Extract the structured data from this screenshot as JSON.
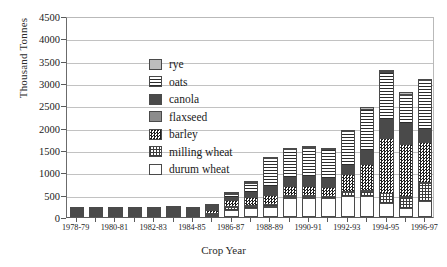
{
  "chart_data": {
    "type": "bar",
    "stacked": true,
    "title": "",
    "xlabel": "Crop Year",
    "ylabel": "Thousand Tonnes",
    "ylim": [
      0,
      4500
    ],
    "ytick_step": 500,
    "grid": true,
    "legend_position": "inside-upper-left",
    "yticks": [
      "0",
      "500",
      "1000",
      "1500",
      "2000",
      "2500",
      "3000",
      "3500",
      "4000",
      "4500"
    ],
    "categories": [
      "1978-79",
      "1979-80",
      "1980-81",
      "1981-82",
      "1982-83",
      "1983-84",
      "1984-85",
      "1985-86",
      "1986-87",
      "1987-88",
      "1988-89",
      "1989-90",
      "1990-91",
      "1991-92",
      "1992-93",
      "1993-94",
      "1994-95",
      "1995-96",
      "1996-97"
    ],
    "xtick_labels": [
      "1978-79",
      "1980-81",
      "1982-83",
      "1984-85",
      "1986-87",
      "1988-89",
      "1990-91",
      "1992-93",
      "1994-95",
      "1996-97"
    ],
    "xtick_label_indices": [
      0,
      2,
      4,
      6,
      8,
      10,
      12,
      14,
      16,
      18
    ],
    "series": [
      {
        "name": "durum wheat",
        "key": "durum",
        "pattern": "white-solid",
        "color": "#ffffff",
        "values": [
          10,
          10,
          15,
          15,
          20,
          25,
          20,
          30,
          150,
          200,
          230,
          430,
          430,
          420,
          470,
          470,
          310,
          200,
          350
        ]
      },
      {
        "name": "milling wheat",
        "key": "milling",
        "pattern": "cross-hatch",
        "color": "#3d3d3d",
        "values": [
          10,
          10,
          15,
          20,
          25,
          30,
          20,
          40,
          95,
          70,
          70,
          60,
          60,
          60,
          110,
          130,
          230,
          270,
          430
        ]
      },
      {
        "name": "barley",
        "key": "barley",
        "pattern": "checkerboard",
        "color": "#1f1f1f",
        "values": [
          15,
          20,
          30,
          35,
          45,
          50,
          35,
          100,
          165,
          200,
          230,
          230,
          240,
          230,
          400,
          610,
          1260,
          1200,
          920
        ]
      },
      {
        "name": "flaxseed",
        "key": "flax",
        "pattern": "mid-gray-solid",
        "color": "#8c8c8c",
        "values": [
          5,
          5,
          5,
          8,
          8,
          10,
          8,
          10,
          15,
          15,
          15,
          15,
          15,
          15,
          20,
          20,
          25,
          25,
          25
        ]
      },
      {
        "name": "canola",
        "key": "canola",
        "pattern": "dark-gray-solid",
        "color": "#4a4a4a",
        "values": [
          5,
          5,
          8,
          10,
          12,
          15,
          10,
          20,
          45,
          90,
          170,
          175,
          185,
          160,
          185,
          300,
          390,
          430,
          270
        ]
      },
      {
        "name": "oats",
        "key": "oats",
        "pattern": "horizontal-stripes",
        "color": "#2b2b2b",
        "values": [
          10,
          15,
          20,
          25,
          30,
          45,
          25,
          35,
          90,
          230,
          640,
          650,
          660,
          670,
          780,
          930,
          1090,
          660,
          1110
        ]
      },
      {
        "name": "rye",
        "key": "rye",
        "pattern": "light-gray-solid",
        "color": "#bdbdbd",
        "values": [
          5,
          5,
          7,
          7,
          10,
          10,
          7,
          10,
          20,
          25,
          25,
          25,
          30,
          25,
          35,
          50,
          50,
          65,
          50
        ]
      }
    ],
    "totals": [
      60,
      70,
      100,
      120,
      150,
      185,
      125,
      245,
      580,
      830,
      1380,
      1585,
      1620,
      1580,
      2000,
      2510,
      3355,
      2850,
      3155
    ]
  },
  "legend": {
    "items": [
      {
        "label": "rye",
        "key": "rye"
      },
      {
        "label": "oats",
        "key": "oats"
      },
      {
        "label": "canola",
        "key": "canola"
      },
      {
        "label": "flaxseed",
        "key": "flax"
      },
      {
        "label": "barley",
        "key": "barley"
      },
      {
        "label": "milling wheat",
        "key": "milling"
      },
      {
        "label": "durum wheat",
        "key": "durum"
      }
    ]
  }
}
